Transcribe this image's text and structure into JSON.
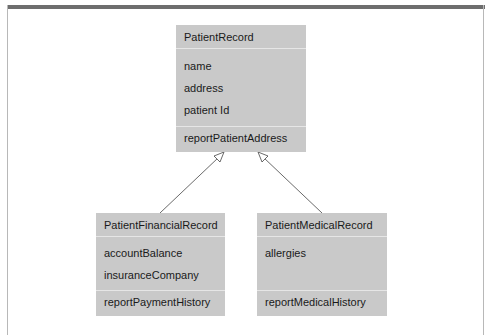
{
  "diagram": {
    "type": "UML class diagram (inheritance)",
    "classes": [
      {
        "name": "PatientRecord",
        "attributes": [
          "name",
          "address",
          "patient Id"
        ],
        "methods": [
          "reportPatientAddress"
        ]
      },
      {
        "name": "PatientFinancialRecord",
        "attributes": [
          "accountBalance",
          "insuranceCompany"
        ],
        "methods": [
          "reportPaymentHistory"
        ]
      },
      {
        "name": "PatientMedicalRecord",
        "attributes": [
          "allergies"
        ],
        "methods": [
          "reportMedicalHistory"
        ]
      }
    ],
    "relations": [
      {
        "from": "PatientFinancialRecord",
        "to": "PatientRecord",
        "kind": "generalization"
      },
      {
        "from": "PatientMedicalRecord",
        "to": "PatientRecord",
        "kind": "generalization"
      }
    ],
    "colors": {
      "box_fill": "#c9c9c9",
      "divider": "#e6e6e6",
      "top_bar": "#6e6e6e",
      "line": "#333333"
    }
  }
}
